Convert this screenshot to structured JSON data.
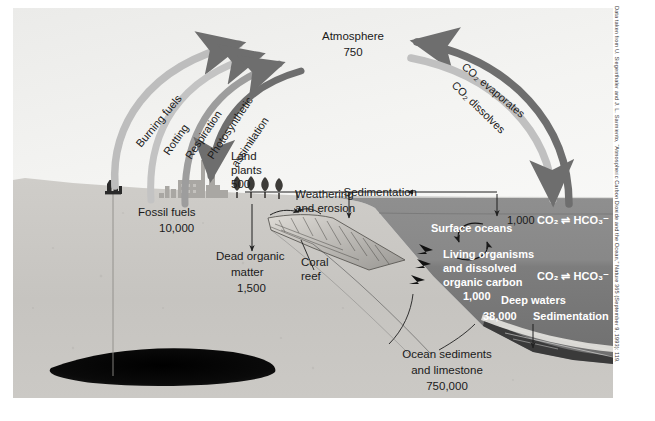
{
  "figure": {
    "title_labels": {
      "atmosphere": "Atmosphere",
      "atmosphere_value": "750",
      "land_plants": "Land\nplants",
      "land_plants_l1": "Land",
      "land_plants_l2": "plants",
      "land_plants_value": "500",
      "fossil_fuels": "Fossil fuels",
      "fossil_fuels_value": "10,000",
      "dead_organic_l1": "Dead organic",
      "dead_organic_l2": "matter",
      "dead_organic_value": "1,500",
      "coral_l1": "Coral",
      "coral_l2": "reef",
      "weathering_l1": "Weathering",
      "weathering_l2": "and erosion",
      "sedimentation_top": "Sedimentation",
      "surface_oceans": "Surface oceans",
      "surface_oceans_value": "1,000",
      "living_l1": "Living organisms",
      "living_l2": "and dissolved",
      "living_l3": "organic carbon",
      "living_value": "1,000",
      "deep_waters": "Deep waters",
      "deep_waters_value": "38,000",
      "sedimentation_deep": "Sedimentation",
      "ocean_sed_l1": "Ocean sediments",
      "ocean_sed_l2": "and limestone",
      "ocean_sed_value": "750,000",
      "co2_surface": "CO₂ ⇌ HCO₃⁻",
      "co2_deep": "CO₂ ⇌ HCO₃⁻"
    },
    "flux_arrows": [
      {
        "label": "Burning fuels",
        "direction": "to-atmosphere"
      },
      {
        "label": "Rotting",
        "direction": "to-atmosphere"
      },
      {
        "label": "Respiration",
        "direction": "to-atmosphere"
      },
      {
        "label": "Photosynthetic\nassimilation",
        "direction": "from-atmosphere"
      },
      {
        "label": "CO₂ evaporates",
        "direction": "to-atmosphere"
      },
      {
        "label": "CO₂ dissolves",
        "direction": "from-atmosphere"
      }
    ],
    "arrow_label_1": "Burning fuels",
    "arrow_label_2": "Rotting",
    "arrow_label_3": "Respiration",
    "arrow_label_4a": "Photosynthetic",
    "arrow_label_4b": "assimilation",
    "arrow_label_5": "CO₂ evaporates",
    "arrow_label_6": "CO₂ dissolves"
  },
  "citation": "Data taken from U. Siegenthaler and J. L. Sarmiento, “Atmospheric Carbon Dioxide and the Ocean,” Nature 365 (September 9, 1993): 119.",
  "colors": {
    "sky": "#f2f2f0",
    "ground": "#c8c6c2",
    "ground_dark": "#b4b2ae",
    "surface_ocean": "#8b8b8b",
    "deep_ocean": "#7a7a7a",
    "arrow_dark": "#6e6e6e",
    "arrow_light": "#b9b9b9",
    "oil": "#0d0d0d",
    "text": "#1a1a1a",
    "text_white": "#ffffff"
  }
}
